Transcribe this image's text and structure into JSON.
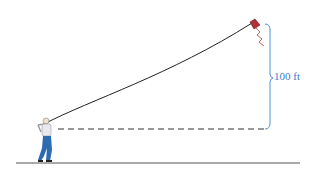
{
  "diagram": {
    "height_label": "100 ft",
    "colors": {
      "string": "#222222",
      "dashed_line": "#333333",
      "ground": "#555555",
      "brace": "#4a90d9",
      "label": "#3a7cc7",
      "kite": "#b0303a",
      "kite_tail": "#c04040",
      "person_shirt": "#e8e8ee",
      "person_pants": "#2e6ab0"
    }
  }
}
